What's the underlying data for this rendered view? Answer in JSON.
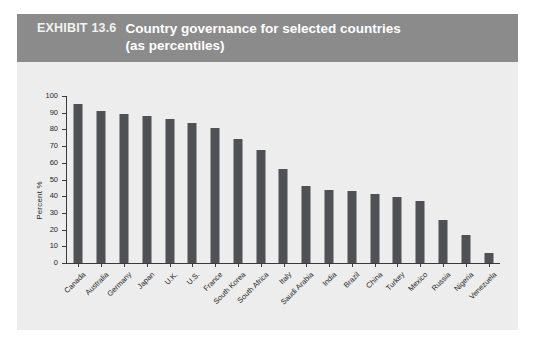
{
  "header": {
    "exhibit_label": "EXHIBIT 13.6",
    "title_line1": "Country governance for selected countries",
    "title_line2": "(as percentiles)",
    "band_color": "#8b8b8b"
  },
  "colors": {
    "panel_background": "#ededed",
    "bar_color": "#4f5154",
    "axis_color": "#3a3a3a",
    "page_background": "#ffffff"
  },
  "chart_data": {
    "type": "bar",
    "title": "Country governance for selected countries (as percentiles)",
    "xlabel": "",
    "ylabel": "Percent %",
    "ylim": [
      0,
      100
    ],
    "ytick_step": 10,
    "yticks": [
      "100",
      "90",
      "80",
      "70",
      "60",
      "50",
      "40",
      "30",
      "20",
      "10",
      "0"
    ],
    "grid": false,
    "legend": null,
    "categories": [
      "Canada",
      "Australia",
      "Germany",
      "Japan",
      "U.K.",
      "U.S.",
      "France",
      "South Korea",
      "South Africa",
      "Italy",
      "Saudi Arabia",
      "India",
      "Brazil",
      "China",
      "Turkey",
      "Mexico",
      "Russia",
      "Nigeria",
      "Venezuela"
    ],
    "values": [
      95,
      91,
      89,
      88,
      86.5,
      84,
      81,
      74,
      67.5,
      56,
      46,
      44,
      43,
      41.5,
      39.5,
      37,
      26,
      16.5,
      6
    ]
  }
}
